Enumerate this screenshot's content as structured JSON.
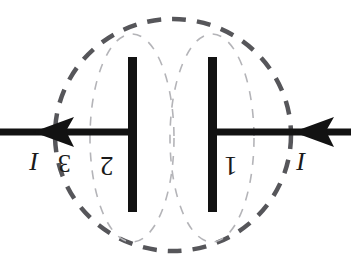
{
  "figure": {
    "background_color": "#ffffff",
    "width": 351,
    "height": 272
  },
  "colors": {
    "plate": "#121212",
    "wire": "#121212",
    "arrow": "#121212",
    "outer_surface": "#56565a",
    "inner_surface": "#b4b4b8",
    "label": "#1a1a1a"
  },
  "labels": {
    "current_left": "I",
    "current_right": "I",
    "surface_3": "3",
    "surface_2": "2",
    "surface_1": "1",
    "rotation_degrees": "180"
  },
  "geometry": {
    "plates": [
      {
        "name": "left-plate",
        "x": 128,
        "y": 57,
        "width": 9,
        "height": 155
      },
      {
        "name": "right-plate",
        "x": 208,
        "y": 57,
        "width": 9,
        "height": 155
      }
    ],
    "wire": {
      "y": 132,
      "thickness": 7,
      "left_segment": {
        "x1": 0,
        "x2": 137
      },
      "right_segment": {
        "x1": 208,
        "x2": 351
      }
    },
    "arrows": [
      {
        "name": "left-current-arrow",
        "tip_x": 33,
        "y": 132,
        "direction": "left"
      },
      {
        "name": "right-current-arrow",
        "tip_x": 293,
        "y": 132,
        "direction": "left"
      }
    ],
    "outer_ellipse": {
      "cx": 173,
      "cy": 135,
      "rx": 118,
      "ry": 116,
      "dash": "14 11",
      "stroke_width": 4.5
    },
    "inner_ellipses": [
      {
        "name": "inner-surface-left",
        "cx": 132,
        "cy": 138,
        "rx": 42,
        "ry": 104,
        "dash": "9 9",
        "stroke_width": 1.6
      },
      {
        "name": "inner-surface-right",
        "cx": 212,
        "cy": 138,
        "rx": 42,
        "ry": 104,
        "dash": "9 9",
        "stroke_width": 1.6
      }
    ]
  }
}
